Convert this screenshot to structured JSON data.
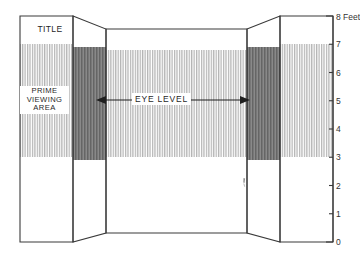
{
  "diagram": {
    "type": "exhibit-panel-elevation",
    "title_panel": {
      "label": "TITLE"
    },
    "prime_viewing": {
      "line1": "PRIME",
      "line2": "VIEWING",
      "line3": "AREA"
    },
    "eye_level": {
      "label": "EYE  LEVEL",
      "arrow": "double-headed-horizontal-arrow"
    },
    "scale": {
      "unit_label": "8 Feet",
      "ticks": [
        "8 Feet",
        "7",
        "6",
        "5",
        "4",
        "3",
        "2",
        "1",
        "0"
      ],
      "tick_values": [
        8,
        7,
        6,
        5,
        4,
        3,
        2,
        1,
        0
      ],
      "min": 0,
      "max": 8
    },
    "bands": {
      "prime_viewing_top_ft": 7,
      "prime_viewing_bottom_ft": 3,
      "eye_level_ft": 5
    },
    "colors": {
      "outline": "#3a3a3a",
      "front_hatch": "#b9b9b9",
      "fold_hatch": "#6d6d6d",
      "text": "#1f1f1f",
      "background": "#ffffff"
    },
    "panels": [
      {
        "name": "left-front-panel",
        "kind": "front"
      },
      {
        "name": "left-fold-panel",
        "kind": "angled"
      },
      {
        "name": "center-panel",
        "kind": "front"
      },
      {
        "name": "right-fold-panel",
        "kind": "angled"
      },
      {
        "name": "right-front-panel",
        "kind": "front"
      }
    ]
  }
}
